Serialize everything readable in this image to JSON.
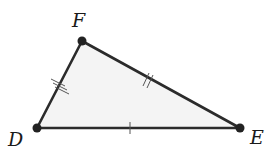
{
  "diagram": {
    "type": "triangle",
    "fill": "#f4f4f4",
    "stroke": "#2b2b2b",
    "vertices": {
      "F": {
        "label": "F",
        "x": 82,
        "y": 41,
        "label_x": 72,
        "label_y": 27
      },
      "D": {
        "label": "D",
        "x": 37,
        "y": 128,
        "label_x": 8,
        "label_y": 146
      },
      "E": {
        "label": "E",
        "x": 240,
        "y": 128,
        "label_x": 250,
        "label_y": 144
      }
    },
    "sides": [
      {
        "name": "DF",
        "tick_marks": 3
      },
      {
        "name": "FE",
        "tick_marks": 2
      },
      {
        "name": "DE",
        "tick_marks": 1
      }
    ]
  }
}
